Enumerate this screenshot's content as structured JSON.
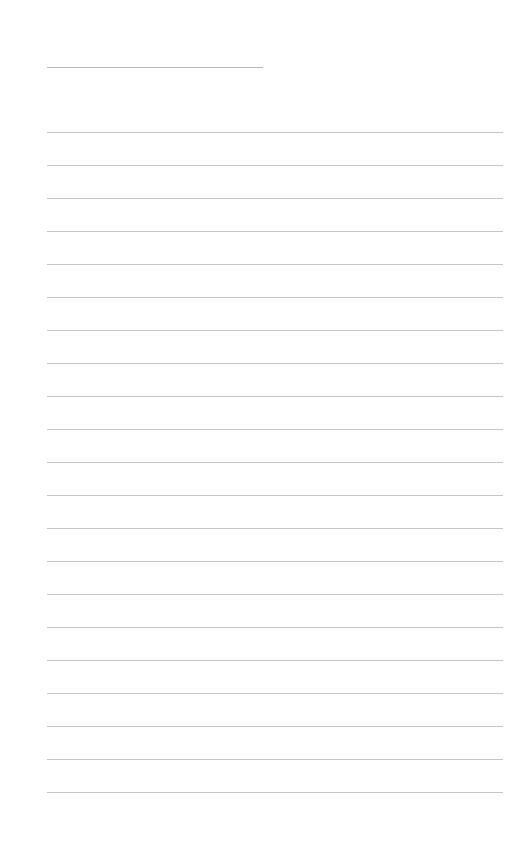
{
  "page": {
    "type": "blank lined sheet",
    "title_line": {
      "label": ""
    },
    "rule_count": 21,
    "rule_start_y": 132,
    "rule_spacing": 33,
    "line_color": "#c4c4c4"
  }
}
